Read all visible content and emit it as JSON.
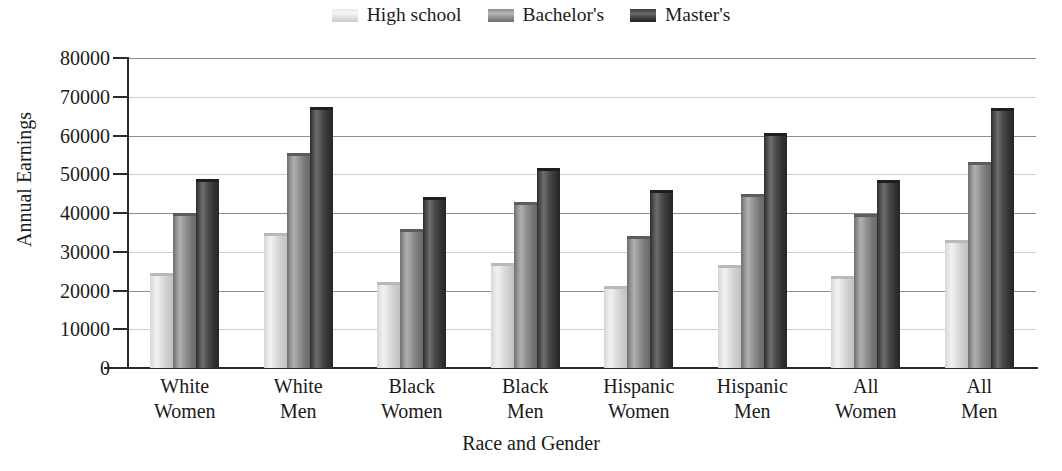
{
  "chart_data": {
    "type": "bar",
    "title": "",
    "xlabel": "Race and Gender",
    "ylabel": "Annual Earnings",
    "ylim": [
      0,
      80000
    ],
    "yticks": [
      0,
      10000,
      20000,
      30000,
      40000,
      50000,
      60000,
      70000,
      80000
    ],
    "ytick_labels": [
      "0",
      "10000",
      "20000",
      "30000",
      "40000",
      "50000",
      "60000",
      "70000",
      "80000"
    ],
    "grid": true,
    "legend_position": "top-center",
    "categories": [
      "White Women",
      "White Men",
      "Black Women",
      "Black Men",
      "Hispanic Women",
      "Hispanic Men",
      "All Women",
      "All Men"
    ],
    "category_lines": [
      [
        "White",
        "Women"
      ],
      [
        "White",
        "Men"
      ],
      [
        "Black",
        "Women"
      ],
      [
        "Black",
        "Men"
      ],
      [
        "Hispanic",
        "Women"
      ],
      [
        "Hispanic",
        "Men"
      ],
      [
        "All",
        "Women"
      ],
      [
        "All",
        "Men"
      ]
    ],
    "series": [
      {
        "name": "High school",
        "key": "hs",
        "color": "#e0e0e0",
        "values": [
          24500,
          34800,
          22200,
          27200,
          21200,
          26700,
          23700,
          33100
        ]
      },
      {
        "name": "Bachelor's",
        "key": "ba",
        "color": "#909090",
        "values": [
          40000,
          55600,
          36000,
          42800,
          34000,
          44900,
          39800,
          53200
        ]
      },
      {
        "name": "Master's",
        "key": "ma",
        "color": "#3a3a3a",
        "values": [
          48700,
          67400,
          44100,
          51500,
          46000,
          60700,
          48600,
          67000
        ]
      }
    ]
  },
  "legend": {
    "items": [
      {
        "label": "High school",
        "key": "hs"
      },
      {
        "label": "Bachelor's",
        "key": "ba"
      },
      {
        "label": "Master's",
        "key": "ma"
      }
    ]
  },
  "axis": {
    "y_title": "Annual Earnings",
    "x_title": "Race and Gender"
  }
}
